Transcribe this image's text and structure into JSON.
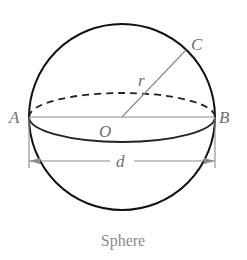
{
  "diagram": {
    "type": "sphere",
    "caption": "Sphere",
    "labels": {
      "A": "A",
      "B": "B",
      "C": "C",
      "O": "O",
      "radius": "r",
      "diameter": "d"
    },
    "colors": {
      "outline": "#111111",
      "construction": "#8c8c8c",
      "label": "#6e6e6e",
      "caption": "#8a8a8a"
    },
    "geometry": {
      "center": [
        122,
        117
      ],
      "radius": 93,
      "equator_front_depth": 25,
      "equator_back_height": 24,
      "point_C": [
        186,
        50
      ]
    }
  }
}
